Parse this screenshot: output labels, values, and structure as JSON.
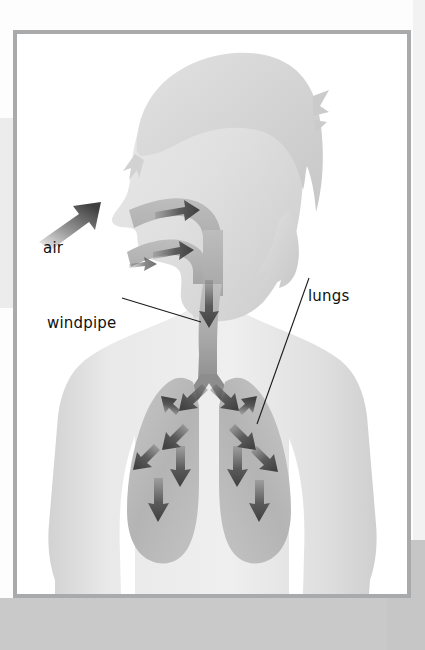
{
  "document": {
    "type": "illustration",
    "subject": "human respiratory system",
    "title": "Breathing: air enters through nose and mouth, travels down the windpipe into the lungs"
  },
  "frame": {
    "border_color": "#a9aaac",
    "background_color": "#ffffff"
  },
  "page_background": {
    "base_color": "#fdfdfd",
    "bottom_band_color": "#c9c9c9",
    "left_block_color": "#ececec"
  },
  "labels": [
    {
      "id": "air",
      "text": "air",
      "x": 26,
      "y": 207,
      "has_leader_line": false,
      "color": "#111111"
    },
    {
      "id": "windpipe",
      "text": "windpipe",
      "x": 30,
      "y": 282,
      "has_leader_line": true,
      "color": "#111111"
    },
    {
      "id": "lungs",
      "text": "lungs",
      "x": 291,
      "y": 255,
      "has_leader_line": true,
      "color": "#111111"
    }
  ],
  "anatomy": {
    "body_fill_light": "#e6e6e6",
    "body_fill_mid": "#d6d6d6",
    "hair_fill": "#d9d9d9",
    "airway_fill": "#b6b6b6",
    "lung_fill": "#b9b9b9",
    "arrow_color": "#4a4a4a",
    "parts": [
      {
        "name": "head",
        "label_ref": null
      },
      {
        "name": "hair",
        "label_ref": null
      },
      {
        "name": "nasal-passage",
        "label_ref": "air"
      },
      {
        "name": "oral-passage",
        "label_ref": "air"
      },
      {
        "name": "windpipe",
        "label_ref": "windpipe"
      },
      {
        "name": "left-lung",
        "label_ref": "lungs"
      },
      {
        "name": "right-lung",
        "label_ref": "lungs"
      },
      {
        "name": "torso",
        "label_ref": null
      }
    ]
  },
  "flow_arrows": {
    "external_air_arrow": {
      "direction": "up-right",
      "count": 1
    },
    "nasal_arrow": {
      "direction": "right",
      "count": 1
    },
    "oral_arrows": {
      "direction": "right",
      "count": 2
    },
    "windpipe_arrow": {
      "direction": "down",
      "count": 1
    },
    "bronchi_arrows": {
      "direction": "down-outward",
      "count": 2
    },
    "left_lung_arrows": {
      "count": 5,
      "directions": [
        "up-left",
        "down-left",
        "down-left",
        "down",
        "down"
      ]
    },
    "right_lung_arrows": {
      "count": 5,
      "directions": [
        "up-right",
        "down-right",
        "down-right",
        "down",
        "down"
      ]
    }
  }
}
